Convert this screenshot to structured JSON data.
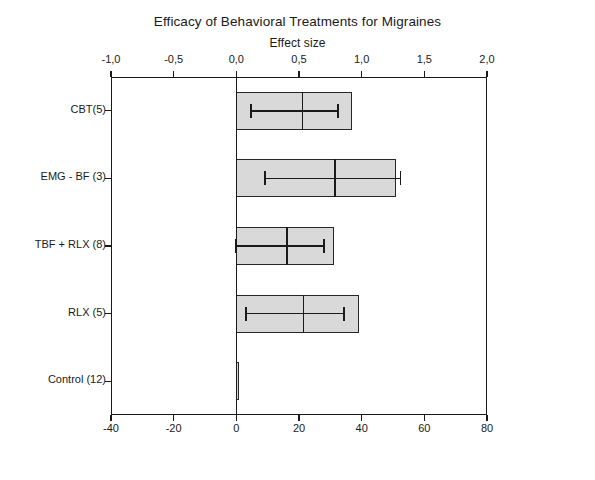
{
  "chart_data": {
    "type": "bar",
    "orientation": "horizontal",
    "title": "Efficacy of Behavioral Treatments for Migraines",
    "xlabel": "Effect size",
    "ylabel": "",
    "categories": [
      "CBT(5)",
      "EMG - BF (3)",
      "TBF + RLX (8)",
      "RLX (5)",
      "Control (12)"
    ],
    "values": [
      0.92,
      1.27,
      0.78,
      0.98,
      0.01
    ],
    "error_low": [
      0.12,
      0.23,
      0.0,
      0.08,
      0.0
    ],
    "error_high": [
      0.81,
      1.31,
      0.7,
      0.86,
      0.01
    ],
    "error_center": [
      0.52,
      0.78,
      0.4,
      0.53,
      0.0
    ],
    "top_axis": {
      "label": "Effect size",
      "ticks": [
        "-1,0",
        "-0,5",
        "0,0",
        "0,5",
        "1,0",
        "1,5",
        "2,0"
      ],
      "tick_values": [
        -1.0,
        -0.5,
        0.0,
        0.5,
        1.0,
        1.5,
        2.0
      ],
      "xlim": [
        -1.0,
        2.0
      ]
    },
    "bottom_axis": {
      "label": "",
      "ticks": [
        "-40",
        "-20",
        "0",
        "20",
        "40",
        "60",
        "80"
      ],
      "tick_values": [
        -40,
        -20,
        0,
        20,
        40,
        60,
        80
      ],
      "xlim": [
        -40,
        80
      ]
    },
    "grid": false,
    "legend": null,
    "bar_fill_color": "#d9d9d9",
    "bar_edge_color": "#262626",
    "error_bar_color": "#1a1a1a",
    "background_color": "#ffffff"
  }
}
